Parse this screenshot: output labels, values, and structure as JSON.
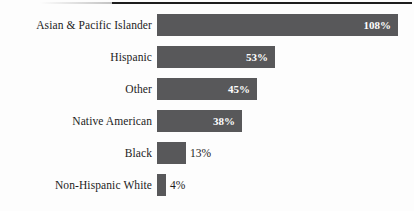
{
  "chart_data": {
    "type": "bar",
    "orientation": "horizontal",
    "title": "",
    "subtitle": "",
    "xlabel": "",
    "ylabel": "",
    "grid": false,
    "legend": null,
    "axis_visible": false,
    "xlim": [
      0,
      108
    ],
    "categories": [
      "Asian & Pacific Islander",
      "Hispanic",
      "Other",
      "Native American",
      "Black",
      "Non-Hispanic White"
    ],
    "values": [
      108,
      53,
      45,
      38,
      13,
      4
    ],
    "value_labels": [
      "108%",
      "53%",
      "45%",
      "38%",
      "13%",
      "4%"
    ],
    "label_placement": [
      "inside",
      "inside",
      "inside",
      "inside",
      "outside",
      "outside"
    ],
    "bars": [
      {
        "category": "Asian & Pacific Islander",
        "value": 108,
        "label": "108%",
        "placement": "inside"
      },
      {
        "category": "Hispanic",
        "value": 53,
        "label": "53%",
        "placement": "inside"
      },
      {
        "category": "Other",
        "value": 45,
        "label": "45%",
        "placement": "inside"
      },
      {
        "category": "Native American",
        "value": 38,
        "label": "38%",
        "placement": "inside"
      },
      {
        "category": "Black",
        "value": 13,
        "label": "13%",
        "placement": "outside"
      },
      {
        "category": "Non-Hispanic White",
        "value": 4,
        "label": "4%",
        "placement": "outside"
      }
    ]
  },
  "style": {
    "bar_color": "#58585a",
    "background_color": "#fdfdfd",
    "inside_label_color": "#ffffff",
    "outside_label_color": "#1c1c1c",
    "category_label_color": "#1c1c1c",
    "top_rule_color": "#1d1d1d"
  }
}
